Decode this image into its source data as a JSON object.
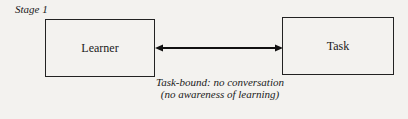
{
  "diagram": {
    "stage_label": "Stage 1",
    "nodes": [
      {
        "id": "learner",
        "label": "Learner"
      },
      {
        "id": "task",
        "label": "Task"
      }
    ],
    "edge": {
      "from": "learner",
      "to": "task",
      "type": "bidirectional-arrow"
    },
    "caption": {
      "line1": "Task-bound: no conversation",
      "line2": "(no awareness of learning)"
    }
  }
}
